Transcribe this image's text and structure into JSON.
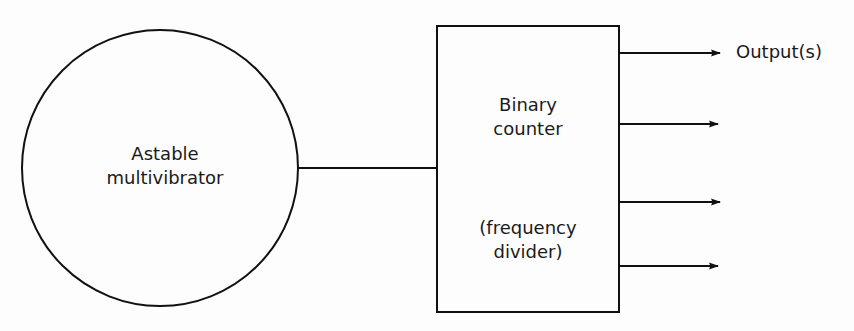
{
  "diagram": {
    "nodes": [
      {
        "id": "oscillator",
        "shape": "circle",
        "label_lines": [
          "Astable",
          "multivibrator"
        ]
      },
      {
        "id": "counter",
        "shape": "rectangle",
        "label_lines": [
          "Binary",
          "counter"
        ],
        "sublabel_lines": [
          "(frequency",
          "divider)"
        ]
      }
    ],
    "edges": [
      {
        "from": "oscillator",
        "to": "counter",
        "arrow": false
      }
    ],
    "outputs": {
      "count": 4,
      "label": "Output(s)"
    },
    "colors": {
      "stroke": "#111111",
      "background": "#fdfdfd"
    }
  }
}
